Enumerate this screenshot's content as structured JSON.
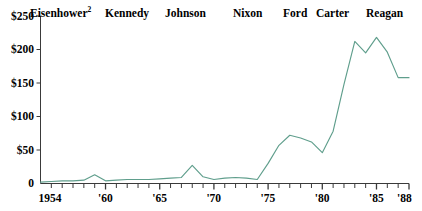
{
  "chart_data": {
    "type": "line",
    "title": "",
    "xlabel": "",
    "ylabel": "",
    "xlim": [
      1954,
      1988
    ],
    "ylim": [
      0,
      250
    ],
    "grid": false,
    "legend_position": "none",
    "line_color": "#5f9e8c",
    "axis_color": "#3a3a3a",
    "y_ticks": [
      {
        "value": 250,
        "label": "$250"
      },
      {
        "value": 200,
        "label": "$200"
      },
      {
        "value": 150,
        "label": "$150"
      },
      {
        "value": 100,
        "label": "$100"
      },
      {
        "value": 50,
        "label": "$50"
      },
      {
        "value": 0,
        "label": "0"
      }
    ],
    "x_ticks": [
      {
        "value": 1954,
        "label": "1954"
      },
      {
        "value": 1960,
        "label": "'60"
      },
      {
        "value": 1965,
        "label": "'65"
      },
      {
        "value": 1970,
        "label": "'70"
      },
      {
        "value": 1975,
        "label": "'75"
      },
      {
        "value": 1980,
        "label": "'80"
      },
      {
        "value": 1985,
        "label": "'85"
      },
      {
        "value": 1988,
        "label": "'88"
      }
    ],
    "x": [
      1954,
      1955,
      1956,
      1957,
      1958,
      1959,
      1960,
      1961,
      1962,
      1963,
      1964,
      1965,
      1966,
      1967,
      1968,
      1969,
      1970,
      1971,
      1972,
      1973,
      1974,
      1975,
      1976,
      1977,
      1978,
      1979,
      1980,
      1981,
      1982,
      1983,
      1984,
      1985,
      1986,
      1987,
      1988
    ],
    "values": [
      2,
      3,
      4,
      4,
      5,
      13,
      4,
      5,
      6,
      6,
      6,
      7,
      8,
      9,
      27,
      10,
      6,
      8,
      9,
      8,
      6,
      30,
      57,
      72,
      68,
      62,
      46,
      78,
      148,
      212,
      195,
      218,
      196,
      158,
      158
    ],
    "annotations": [
      {
        "text": "Eisenhower",
        "footnote": "2",
        "x_start": 1954,
        "x_end": 1960
      },
      {
        "text": "Kennedy",
        "x_start": 1961,
        "x_end": 1963
      },
      {
        "text": "Johnson",
        "x_start": 1963,
        "x_end": 1968
      },
      {
        "text": "Nixon",
        "x_start": 1969,
        "x_end": 1974
      },
      {
        "text": "Ford",
        "x_start": 1974,
        "x_end": 1976
      },
      {
        "text": "Carter",
        "x_start": 1977,
        "x_end": 1980
      },
      {
        "text": "Reagan",
        "x_start": 1981,
        "x_end": 1988
      }
    ]
  },
  "era_labels": [
    {
      "text": "Eisenhower",
      "footnote": "2"
    },
    {
      "text": "Kennedy",
      "footnote": ""
    },
    {
      "text": "Johnson",
      "footnote": ""
    },
    {
      "text": "Nixon",
      "footnote": ""
    },
    {
      "text": "Ford",
      "footnote": ""
    },
    {
      "text": "Carter",
      "footnote": ""
    },
    {
      "text": "Reagan",
      "footnote": ""
    }
  ]
}
